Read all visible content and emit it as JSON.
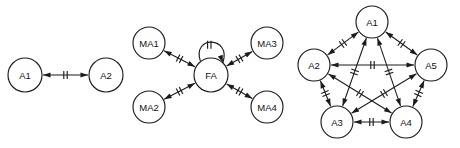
{
  "figure": {
    "title": "",
    "background_color": "#ffffff",
    "stroke_color": "#1b1b1b",
    "width": 460,
    "height": 148,
    "panel_count": 3
  },
  "panels": [
    {
      "id": "panel-dyad",
      "name": "two-node-dyad",
      "nodes": [
        {
          "id": "p1-a1",
          "label": "A1",
          "cx": 25,
          "cy": 75,
          "r": 17
        },
        {
          "id": "p1-a2",
          "label": "A2",
          "cx": 106,
          "cy": 75,
          "r": 17
        }
      ],
      "edges": [
        {
          "id": "p1-e1",
          "from": "p1-a1",
          "to": "p1-a2",
          "bidirectional": true,
          "ticks": 2
        }
      ],
      "self_loops": []
    },
    {
      "id": "panel-star",
      "name": "star-hub-fa",
      "nodes": [
        {
          "id": "p2-ma1",
          "label": "MA1",
          "cx": 149,
          "cy": 43,
          "r": 16
        },
        {
          "id": "p2-ma2",
          "label": "MA2",
          "cx": 149,
          "cy": 107,
          "r": 16
        },
        {
          "id": "p2-fa",
          "label": "FA",
          "cx": 211,
          "cy": 75,
          "r": 17
        },
        {
          "id": "p2-ma3",
          "label": "MA3",
          "cx": 267,
          "cy": 43,
          "r": 16
        },
        {
          "id": "p2-ma4",
          "label": "MA4",
          "cx": 267,
          "cy": 107,
          "r": 16
        }
      ],
      "edges": [
        {
          "id": "p2-e1",
          "from": "p2-fa",
          "to": "p2-ma1",
          "bidirectional": true,
          "ticks": 2
        },
        {
          "id": "p2-e2",
          "from": "p2-fa",
          "to": "p2-ma2",
          "bidirectional": true,
          "ticks": 2
        },
        {
          "id": "p2-e3",
          "from": "p2-fa",
          "to": "p2-ma3",
          "bidirectional": true,
          "ticks": 2
        },
        {
          "id": "p2-e4",
          "from": "p2-fa",
          "to": "p2-ma4",
          "bidirectional": true,
          "ticks": 2
        }
      ],
      "self_loops": [
        {
          "id": "p2-loop-fa",
          "node": "p2-fa",
          "position": "top",
          "ticks": 2,
          "arrow": true
        }
      ]
    },
    {
      "id": "panel-pentagon",
      "name": "complete-pentagon-k5",
      "nodes": [
        {
          "id": "p3-a1",
          "label": "A1",
          "cx": 372,
          "cy": 22,
          "r": 16
        },
        {
          "id": "p3-a2",
          "label": "A2",
          "cx": 314,
          "cy": 65,
          "r": 16
        },
        {
          "id": "p3-a5",
          "label": "A5",
          "cx": 431,
          "cy": 65,
          "r": 16
        },
        {
          "id": "p3-a3",
          "label": "A3",
          "cx": 337,
          "cy": 122,
          "r": 16
        },
        {
          "id": "p3-a4",
          "label": "A4",
          "cx": 406,
          "cy": 122,
          "r": 16
        }
      ],
      "edges": [
        {
          "id": "p3-e1",
          "from": "p3-a1",
          "to": "p3-a2",
          "bidirectional": true,
          "ticks": 2
        },
        {
          "id": "p3-e2",
          "from": "p3-a1",
          "to": "p3-a5",
          "bidirectional": true,
          "ticks": 2
        },
        {
          "id": "p3-e3",
          "from": "p3-a1",
          "to": "p3-a3",
          "bidirectional": true,
          "ticks": 2
        },
        {
          "id": "p3-e4",
          "from": "p3-a1",
          "to": "p3-a4",
          "bidirectional": true,
          "ticks": 2
        },
        {
          "id": "p3-e5",
          "from": "p3-a2",
          "to": "p3-a5",
          "bidirectional": true,
          "ticks": 2
        },
        {
          "id": "p3-e6",
          "from": "p3-a2",
          "to": "p3-a3",
          "bidirectional": true,
          "ticks": 2
        },
        {
          "id": "p3-e7",
          "from": "p3-a2",
          "to": "p3-a4",
          "bidirectional": true,
          "ticks": 2
        },
        {
          "id": "p3-e8",
          "from": "p3-a5",
          "to": "p3-a3",
          "bidirectional": true,
          "ticks": 2
        },
        {
          "id": "p3-e9",
          "from": "p3-a5",
          "to": "p3-a4",
          "bidirectional": true,
          "ticks": 2
        },
        {
          "id": "p3-e10",
          "from": "p3-a3",
          "to": "p3-a4",
          "bidirectional": true,
          "ticks": 2
        }
      ],
      "self_loops": []
    }
  ],
  "style": {
    "node_font_size": 9.5,
    "node_fill": "#ffffff",
    "node_stroke": "#1b1b1b",
    "edge_stroke": "#1b1b1b",
    "arrow_length": 7.5,
    "arrow_width": 5.2,
    "tick_half_height": 4,
    "tick_gap": 3.4
  }
}
